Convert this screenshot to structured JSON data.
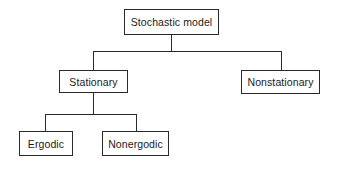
{
  "diagram": {
    "type": "tree",
    "root": {
      "label": "Stochastic model",
      "children": [
        {
          "label": "Stationary",
          "children": [
            {
              "label": "Ergodic"
            },
            {
              "label": "Nonergodic"
            }
          ]
        },
        {
          "label": "Nonstationary"
        }
      ]
    },
    "nodes": {
      "root": "Stochastic model",
      "stationary": "Stationary",
      "nonstationary": "Nonstationary",
      "ergodic": "Ergodic",
      "nonergodic": "Nonergodic"
    },
    "colors": {
      "line": "#2a2a2a",
      "background": "#ffffff",
      "text": "#1a1a1a"
    }
  }
}
